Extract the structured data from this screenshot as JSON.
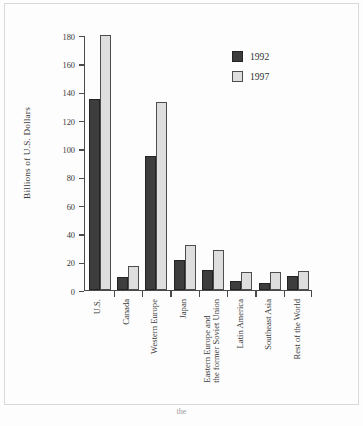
{
  "chart_data": {
    "type": "bar",
    "title": "",
    "xlabel": "",
    "ylabel": "Billions of U.S. Dollars",
    "ylim": [
      0,
      180
    ],
    "yticks": [
      0,
      20,
      40,
      60,
      80,
      100,
      120,
      140,
      160,
      180
    ],
    "grid": false,
    "legend_position": "top-right",
    "categories": [
      "U.S.",
      "Canada",
      "Western Europe",
      "Eastern Europe and|the former Soviet Union",
      "Japan",
      "Latin America",
      "Southeast Asia",
      "Rest of the World"
    ],
    "category_labels": [
      {
        "line1": "U.S.",
        "line2": ""
      },
      {
        "line1": "Canada",
        "line2": ""
      },
      {
        "line1": "Western Europe",
        "line2": ""
      },
      {
        "line1": "Japan",
        "line2": ""
      },
      {
        "line1": "Eastern Europe and",
        "line2": "the former Soviet Union"
      },
      {
        "line1": "Latin America",
        "line2": ""
      },
      {
        "line1": "Southeast Asia",
        "line2": ""
      },
      {
        "line1": "Rest of the World",
        "line2": ""
      }
    ],
    "series": [
      {
        "name": "1992",
        "color": "#3d3d3d",
        "values": [
          135,
          9,
          95,
          21,
          14,
          6,
          4.5,
          10
        ]
      },
      {
        "name": "1997",
        "color": "#dedede",
        "values": [
          181,
          17,
          133,
          32,
          28,
          12.5,
          12.5,
          13
        ]
      }
    ]
  },
  "legend": {
    "items": [
      {
        "label": "1992",
        "color": "#3d3d3d"
      },
      {
        "label": "1997",
        "color": "#dedede"
      }
    ]
  },
  "axis": {
    "y_title": "Billions of U.S. Dollars",
    "y_tick_labels": [
      "0",
      "20",
      "40",
      "60",
      "80",
      "100",
      "120",
      "140",
      "160",
      "180"
    ]
  },
  "page": {
    "caption_fragment": "the"
  },
  "colors": {
    "series_1992": "#3d3d3d",
    "series_1997": "#dedede",
    "axis": "#4a4a4a",
    "text": "#3a3a3a",
    "background": "#fdfdfd",
    "frame": "#d9d9d9"
  }
}
